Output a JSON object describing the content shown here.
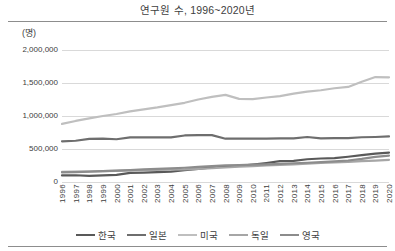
{
  "chart_data": {
    "type": "line",
    "title": "연구원 수, 1996~2020년",
    "unit_label": "(명)",
    "xlabel": "",
    "ylabel": "",
    "ylim": [
      0,
      2000000
    ],
    "ytick_labels": [
      "2,000,000",
      "1,500,000",
      "1,000,000",
      "500,000",
      "0"
    ],
    "ytick_values": [
      2000000,
      1500000,
      1000000,
      500000,
      0
    ],
    "grid": true,
    "legend_position": "bottom",
    "categories": [
      "1996",
      "1997",
      "1998",
      "1999",
      "2000",
      "2001",
      "2002",
      "2003",
      "2004",
      "2005",
      "2006",
      "2007",
      "2008",
      "2009",
      "2010",
      "2011",
      "2012",
      "2013",
      "2014",
      "2015",
      "2016",
      "2017",
      "2018",
      "2019",
      "2020"
    ],
    "series": [
      {
        "name": "한국",
        "color": "#595959",
        "width": 2.2,
        "values": [
          99000,
          102000,
          92000,
          100000,
          108000,
          137000,
          142000,
          151000,
          157000,
          179000,
          200000,
          221000,
          236000,
          244000,
          264000,
          288000,
          315000,
          321000,
          345000,
          356000,
          361000,
          383000,
          408000,
          431000,
          446000
        ]
      },
      {
        "name": "일본",
        "color": "#6e6e6e",
        "width": 2.2,
        "values": [
          617000,
          625000,
          653000,
          658000,
          648000,
          675000,
          677000,
          675000,
          677000,
          705000,
          710000,
          710000,
          656000,
          656000,
          656000,
          657000,
          660000,
          661000,
          682000,
          662000,
          665000,
          666000,
          678000,
          682000,
          690000
        ]
      },
      {
        "name": "미국",
        "color": "#bfbfbf",
        "width": 2.2,
        "values": [
          880000,
          925000,
          965000,
          1000000,
          1030000,
          1070000,
          1100000,
          1130000,
          1165000,
          1200000,
          1250000,
          1290000,
          1320000,
          1260000,
          1255000,
          1280000,
          1300000,
          1340000,
          1370000,
          1390000,
          1420000,
          1440000,
          1520000,
          1590000,
          1586000
        ]
      },
      {
        "name": "독일",
        "color": "#a6a6a6",
        "width": 2.2,
        "values": [
          153000,
          156000,
          159000,
          165000,
          170000,
          176000,
          182000,
          185000,
          187000,
          190000,
          198000,
          208000,
          220000,
          231000,
          240000,
          250000,
          260000,
          268000,
          278000,
          288000,
          296000,
          306000,
          316000,
          325000,
          335000
        ]
      },
      {
        "name": "영국",
        "color": "#8c8c8c",
        "width": 2.2,
        "values": [
          145000,
          150000,
          158000,
          165000,
          171000,
          180000,
          190000,
          198000,
          206000,
          216000,
          228000,
          240000,
          251000,
          256000,
          262000,
          268000,
          276000,
          284000,
          292000,
          300000,
          312000,
          326000,
          350000,
          380000,
          400000
        ]
      }
    ]
  },
  "legend": {
    "items": [
      {
        "label": "한국",
        "color": "#595959"
      },
      {
        "label": "일본",
        "color": "#6e6e6e"
      },
      {
        "label": "미국",
        "color": "#bfbfbf"
      },
      {
        "label": "독일",
        "color": "#a6a6a6"
      },
      {
        "label": "영국",
        "color": "#8c8c8c"
      }
    ]
  },
  "style": {
    "gridline_color": "#d9d9d9",
    "rule_color": "#8d8d8d",
    "text_color": "#3d3d3d",
    "background": "#ffffff"
  }
}
